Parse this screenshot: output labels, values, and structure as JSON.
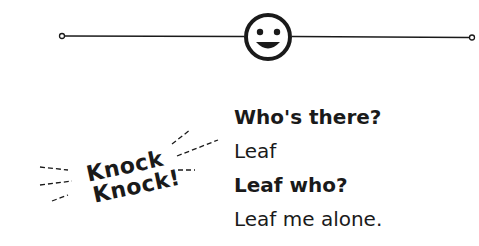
{
  "header": {
    "icon": "smiley-face-icon",
    "line_color": "#1a1a1a"
  },
  "knock": {
    "line1": "Knock",
    "line2": "Knock!"
  },
  "dialog": [
    {
      "text": "Who's there?",
      "bold": true
    },
    {
      "text": "Leaf",
      "bold": false
    },
    {
      "text": "Leaf who?",
      "bold": true
    },
    {
      "text": "Leaf me alone.",
      "bold": false
    }
  ]
}
